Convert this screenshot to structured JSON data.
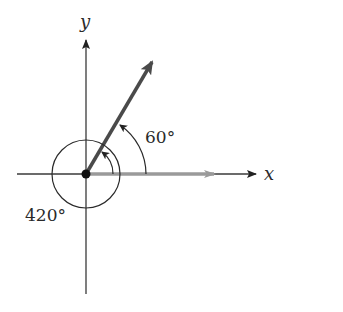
{
  "diagram": {
    "type": "coterminal-angles",
    "axes": {
      "x_label": "x",
      "y_label": "y"
    },
    "angles": [
      {
        "label": "60°",
        "degrees": 60,
        "description": "standard angle measured counterclockwise from positive x-axis"
      },
      {
        "label": "420°",
        "degrees": 420,
        "description": "one full rotation plus 60°, coterminal with 60°"
      }
    ],
    "initial_side": {
      "direction": "positive x-axis",
      "color": "#9a9a9a"
    },
    "terminal_side": {
      "angle_degrees": 60,
      "color": "#4a4a4a"
    },
    "colors": {
      "axis": "#3a3a3a",
      "arc": "#2a2a2a",
      "initial_ray": "#9a9a9a",
      "terminal_ray": "#4a4a4a",
      "vertex": "#111111"
    }
  }
}
